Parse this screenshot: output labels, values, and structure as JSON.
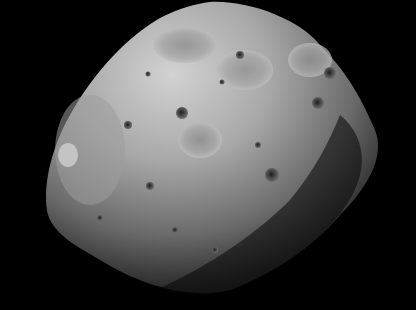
{
  "image": {
    "subject": "cratered moon (Phobos)",
    "background_color": "#000000",
    "body_light_color": "#c8c8c8",
    "body_mid_color": "#8a8a8a",
    "body_shadow_color": "#2a2a2a",
    "width": 416,
    "height": 310
  }
}
